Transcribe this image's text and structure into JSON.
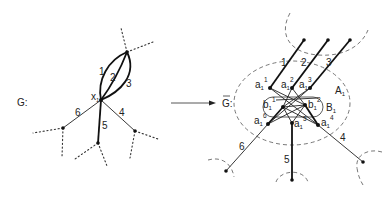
{
  "figure": {
    "left_graph": {
      "label": "G:",
      "vertex_label": "x",
      "vertex_subscript": "1",
      "edge_labels": [
        "1",
        "2",
        "3",
        "4",
        "5",
        "6"
      ]
    },
    "arrow": "→",
    "right_graph": {
      "label": "G:",
      "label_bar": "‾",
      "a_vertices": [
        {
          "base": "a",
          "sub": "1",
          "sup": "1"
        },
        {
          "base": "a",
          "sub": "1",
          "sup": "2"
        },
        {
          "base": "a",
          "sub": "1",
          "sup": "3"
        },
        {
          "base": "a",
          "sub": "1",
          "sup": "4"
        },
        {
          "base": "a",
          "sub": "1",
          "sup": "5"
        },
        {
          "base": "a",
          "sub": "1",
          "sup": "6"
        }
      ],
      "b_vertices": [
        {
          "base": "b",
          "sub": "1",
          "sup": "1"
        },
        {
          "base": "b",
          "sub": "1",
          "sup": "2"
        }
      ],
      "set_A": {
        "base": "A",
        "sub": "1"
      },
      "set_B": {
        "base": "B",
        "sub": "1"
      },
      "edge_labels": [
        "1",
        "2",
        "3",
        "4",
        "5",
        "6"
      ]
    }
  }
}
